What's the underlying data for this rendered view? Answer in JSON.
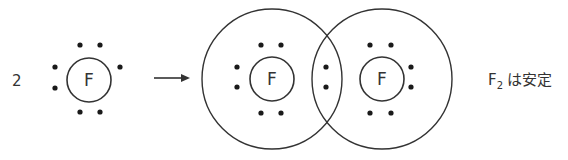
{
  "diagram": {
    "reactant": {
      "coefficient": "2",
      "atom_symbol": "F",
      "valence_electrons": 7
    },
    "arrow": "→",
    "product": {
      "left_atom_symbol": "F",
      "right_atom_symbol": "F",
      "shared_electrons": 2
    },
    "caption": {
      "formula_main": "F",
      "formula_subscript": "2",
      "text": "は安定"
    },
    "colors": {
      "line": "#333333",
      "dot": "#1a1a1a",
      "background": "#ffffff"
    }
  }
}
